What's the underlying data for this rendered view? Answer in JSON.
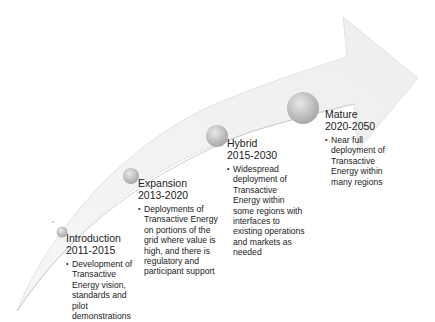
{
  "diagram": {
    "type": "curved-arrow-timeline",
    "colors": {
      "arrow_fill": "#f1f1f1",
      "arrow_edge": "#d8d8d8",
      "inner_curve": "#cfcfcf",
      "circle_light": "#e6e6e6",
      "circle_dark": "#a9a9a9",
      "text": "#222222"
    },
    "stages": [
      {
        "name": "Introduction",
        "years": "2011-2015",
        "bullet": "Development of\nTransactive\nEnergy vision,\nstandards and\npilot\ndemonstrations"
      },
      {
        "name": "Expansion",
        "years": "2013-2020",
        "bullet": "Deployments of\nTransactive Energy\non portions of the\ngrid where value is\nhigh, and there is\nregulatory and\nparticipant support"
      },
      {
        "name": "Hybrid",
        "years": "2015-2030",
        "bullet": "Widespread\ndeployment of\nTransactive\nEnergy within\nsome regions with\ninterfaces to\nexisting operations\nand markets as\nneeded"
      },
      {
        "name": "Mature",
        "years": "2020-2050",
        "bullet": "Near full\ndeployment of\nTransactive\nEnergy within\nmany regions"
      }
    ]
  }
}
